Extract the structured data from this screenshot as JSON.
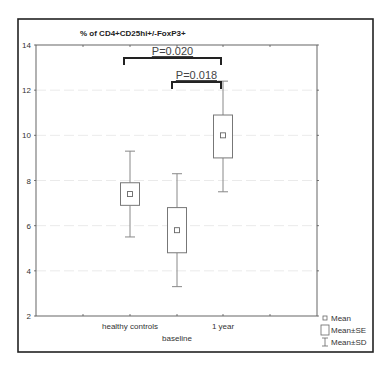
{
  "chart_data": {
    "type": "boxplot",
    "title": "% of CD4+CD25hi+/-FoxP3+",
    "xlabel": "",
    "ylabel": "",
    "ylim": [
      2,
      14
    ],
    "yticks": [
      2,
      4,
      6,
      8,
      10,
      12,
      14
    ],
    "grid": true,
    "categories": [
      "healthy controls",
      "baseline",
      "1 year"
    ],
    "series": [
      {
        "category": "healthy controls",
        "mean": 7.4,
        "se_low": 6.9,
        "se_high": 7.9,
        "sd_low": 5.5,
        "sd_high": 9.3
      },
      {
        "category": "baseline",
        "mean": 5.8,
        "se_low": 4.8,
        "se_high": 6.8,
        "sd_low": 3.3,
        "sd_high": 8.3
      },
      {
        "category": "1 year",
        "mean": 10.0,
        "se_low": 9.0,
        "se_high": 10.9,
        "sd_low": 7.5,
        "sd_high": 12.4
      }
    ],
    "annotations": [
      {
        "label": "P=0.020",
        "from": "healthy controls",
        "to": "1 year"
      },
      {
        "label": "P=0.018",
        "from": "baseline",
        "to": "1 year"
      }
    ],
    "legend": {
      "position": "bottom-right",
      "items": [
        {
          "symbol": "small-square",
          "label": "Mean"
        },
        {
          "symbol": "box",
          "label": "Mean±SE"
        },
        {
          "symbol": "whisker",
          "label": "Mean±SD"
        }
      ]
    }
  }
}
